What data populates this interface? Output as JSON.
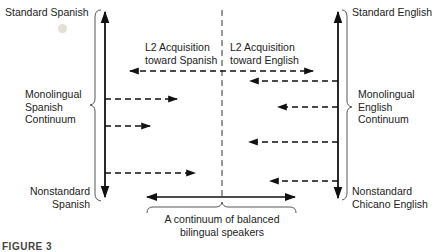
{
  "diagram": {
    "left_axis": {
      "top_label": "Standard Spanish",
      "middle_label": [
        "Monolingual",
        "Spanish",
        "Continuum"
      ],
      "bottom_label": [
        "Nonstandard",
        "Spanish"
      ]
    },
    "right_axis": {
      "top_label": "Standard English",
      "middle_label": [
        "Monolingual",
        "English",
        "Continuum"
      ],
      "bottom_label": [
        "Nonstandard",
        "Chicano English"
      ]
    },
    "center": {
      "left_heading": [
        "L2 Acquisition",
        "toward Spanish"
      ],
      "right_heading": [
        "L2 Acquisition",
        "toward English"
      ]
    },
    "bottom": {
      "caption": [
        "A continuum of balanced",
        "bilingual speakers"
      ]
    },
    "figure_label": "FIGURE 3",
    "colors": {
      "line": "#111111",
      "text": "#222222",
      "background": "#ffffff"
    }
  }
}
